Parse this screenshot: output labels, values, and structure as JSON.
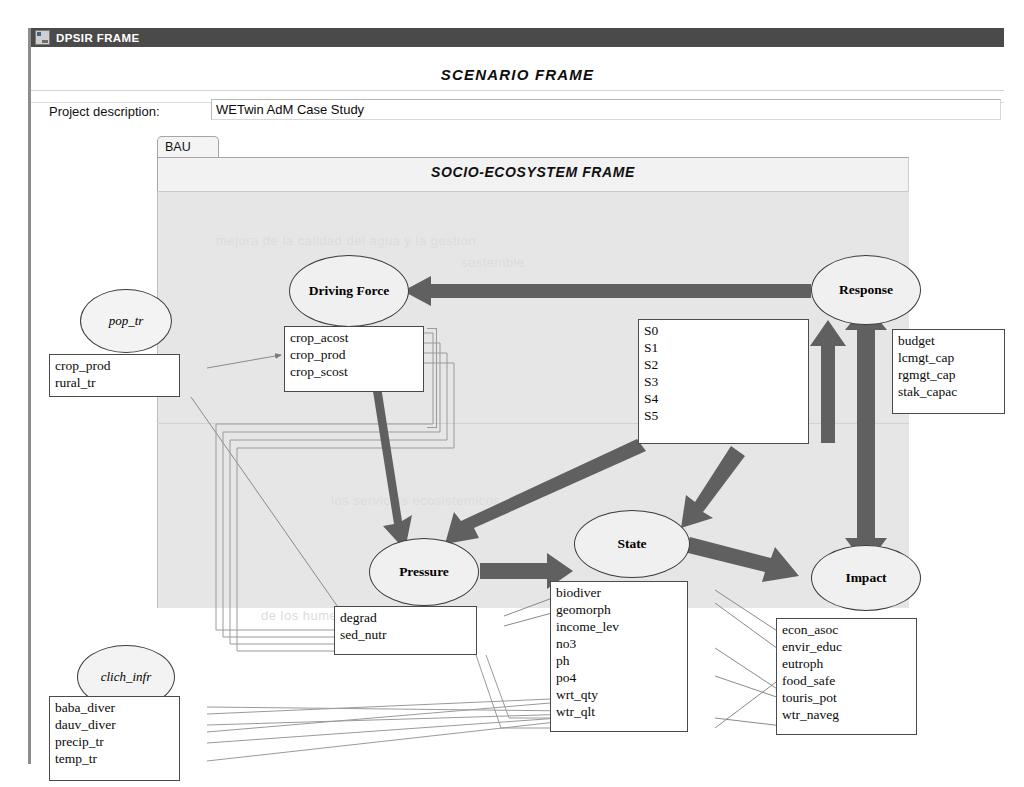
{
  "window": {
    "title": "DPSIR FRAME",
    "icon": "app-icon"
  },
  "header": {
    "scenario_title": "SCENARIO  FRAME",
    "project_label": "Project description:",
    "project_value": "WETwin AdM Case Study",
    "project_placeholder": "Project description"
  },
  "tabs": [
    {
      "label": "BAU",
      "selected": true
    }
  ],
  "panel": {
    "socio_title": "SOCIO-ECOSYSTEM FRAME"
  },
  "watermarks": [
    "mejora de la calidad del agua y la gestion",
    "sostenible",
    "los servicios ecosistemicos",
    "de los humedales en la cuenca"
  ],
  "colors": {
    "arrow": "#606060",
    "canvas": "#e6e6e6",
    "titlebar": "#4a4a4a",
    "node_fill": "#f0f0f0",
    "box_border": "#4a4a4a"
  },
  "diagram": {
    "nodes": [
      {
        "id": "driving-force",
        "label": "Driving Force",
        "kind": "dpsir",
        "cx": 318,
        "cy": 263,
        "rx": 60,
        "ry": 36
      },
      {
        "id": "response",
        "label": "Response",
        "kind": "dpsir",
        "cx": 835,
        "cy": 262,
        "rx": 55,
        "ry": 35
      },
      {
        "id": "pressure",
        "label": "Pressure",
        "kind": "dpsir",
        "cx": 393,
        "cy": 544,
        "rx": 55,
        "ry": 34
      },
      {
        "id": "state",
        "label": "State",
        "kind": "dpsir",
        "cx": 601,
        "cy": 516,
        "rx": 58,
        "ry": 34
      },
      {
        "id": "impact",
        "label": "Impact",
        "kind": "dpsir",
        "cx": 835,
        "cy": 550,
        "rx": 55,
        "ry": 33
      },
      {
        "id": "pop-tr",
        "label": "pop_tr",
        "kind": "external",
        "cx": 95,
        "cy": 293,
        "rx": 46,
        "ry": 32
      },
      {
        "id": "clich-infr",
        "label": "clich_infr",
        "kind": "external",
        "cx": 95,
        "cy": 649,
        "rx": 49,
        "ry": 32
      }
    ],
    "boxes": [
      {
        "id": "driving-force-vars",
        "title": "driving-force-variables",
        "x": 253,
        "y": 298,
        "w": 140,
        "h": 66,
        "items": [
          "crop_acost",
          "crop_prod",
          "crop_scost"
        ]
      },
      {
        "id": "scenario-list",
        "title": "scenario-list",
        "x": 607,
        "y": 291,
        "w": 171,
        "h": 125,
        "items": [
          "S0",
          "S1",
          "S2",
          "S3",
          "S4",
          "S5"
        ]
      },
      {
        "id": "response-vars",
        "title": "response-variables",
        "x": 861,
        "y": 301,
        "w": 113,
        "h": 85,
        "items": [
          "budget",
          "lcmgt_cap",
          "rgmgt_cap",
          "stak_capac"
        ]
      },
      {
        "id": "pop-tr-vars",
        "title": "pop-tr-variables",
        "x": 45,
        "y": 326,
        "w": 131,
        "h": 43,
        "items": [
          "crop_prod",
          "rural_tr"
        ]
      },
      {
        "id": "pressure-vars",
        "title": "pressure-variables",
        "x": 330,
        "y": 578,
        "w": 143,
        "h": 49,
        "items": [
          "degrad",
          "sed_nutr"
        ]
      },
      {
        "id": "state-vars",
        "title": "state-variables",
        "x": 546,
        "y": 553,
        "w": 138,
        "h": 151,
        "items": [
          "biodiver",
          "geomorph",
          "income_lev",
          "no3",
          "ph",
          "po4",
          "wrt_qty",
          "wtr_qlt"
        ]
      },
      {
        "id": "impact-vars",
        "title": "impact-variables",
        "x": 772,
        "y": 590,
        "w": 141,
        "h": 117,
        "items": [
          "econ_asoc",
          "envir_educ",
          "eutroph",
          "food_safe",
          "touris_pot",
          "wtr_naveg"
        ]
      },
      {
        "id": "clich-infr-vars",
        "title": "clich-infr-variables",
        "x": 45,
        "y": 668,
        "w": 131,
        "h": 85,
        "items": [
          "baba_diver",
          "dauv_diver",
          "precip_tr",
          "temp_tr"
        ]
      }
    ],
    "flows": [
      {
        "from": "response",
        "to": "driving-force",
        "style": "thick"
      },
      {
        "from": "driving-force",
        "to": "pressure",
        "style": "thick"
      },
      {
        "from": "pressure",
        "to": "state",
        "style": "thick"
      },
      {
        "from": "state",
        "to": "impact",
        "style": "thick"
      },
      {
        "from": "impact",
        "to": "response",
        "style": "thick-bidir"
      },
      {
        "from": "scenario-list",
        "to": "pressure",
        "style": "thick"
      },
      {
        "from": "scenario-list",
        "to": "state",
        "style": "thick"
      },
      {
        "from": "scenario-list",
        "to": "response",
        "style": "thick"
      }
    ]
  }
}
